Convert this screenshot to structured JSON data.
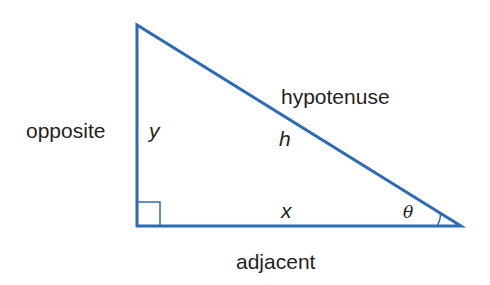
{
  "diagram": {
    "type": "right-triangle",
    "stroke_color": "#2e6bb5",
    "text_color": "#231f20",
    "labels": {
      "opposite": "opposite",
      "hypotenuse": "hypotenuse",
      "adjacent": "adjacent",
      "y": "y",
      "h": "h",
      "x": "x",
      "theta": "θ"
    }
  }
}
